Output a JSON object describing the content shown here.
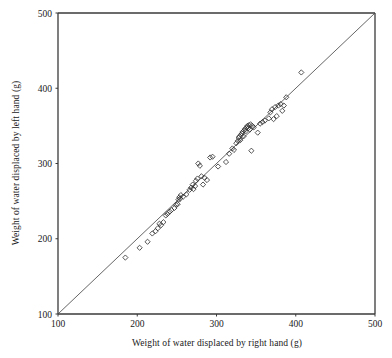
{
  "chart_data": {
    "type": "scatter",
    "title": "",
    "xlabel": "Weight of water displaced by right hand (g)",
    "ylabel": "Weight of water displaced by left hand (g)",
    "xlim": [
      100,
      500
    ],
    "ylim": [
      100,
      500
    ],
    "xticks": [
      100,
      200,
      300,
      400,
      500
    ],
    "yticks": [
      100,
      200,
      300,
      400,
      500
    ],
    "grid": false,
    "legend": null,
    "marker": "open-diamond",
    "marker_size": 4,
    "reference_line": {
      "name": "identity-line",
      "type": "line",
      "slope": 1,
      "intercept": 0,
      "x": [
        100,
        500
      ],
      "y": [
        100,
        500
      ]
    },
    "points": [
      [
        185,
        175
      ],
      [
        203,
        188
      ],
      [
        213,
        196
      ],
      [
        219,
        207
      ],
      [
        223,
        210
      ],
      [
        226,
        214
      ],
      [
        228,
        220
      ],
      [
        230,
        218
      ],
      [
        233,
        222
      ],
      [
        236,
        231
      ],
      [
        238,
        233
      ],
      [
        241,
        236
      ],
      [
        243,
        238
      ],
      [
        247,
        241
      ],
      [
        249,
        245
      ],
      [
        251,
        246
      ],
      [
        252,
        252
      ],
      [
        253,
        255
      ],
      [
        254,
        253
      ],
      [
        255,
        258
      ],
      [
        258,
        256
      ],
      [
        262,
        259
      ],
      [
        266,
        265
      ],
      [
        268,
        268
      ],
      [
        270,
        272
      ],
      [
        271,
        266
      ],
      [
        273,
        270
      ],
      [
        274,
        277
      ],
      [
        276,
        280
      ],
      [
        277,
        300
      ],
      [
        279,
        297
      ],
      [
        281,
        283
      ],
      [
        283,
        272
      ],
      [
        285,
        281
      ],
      [
        288,
        278
      ],
      [
        292,
        308
      ],
      [
        295,
        309
      ],
      [
        302,
        296
      ],
      [
        312,
        302
      ],
      [
        316,
        313
      ],
      [
        320,
        320
      ],
      [
        322,
        318
      ],
      [
        325,
        327
      ],
      [
        327,
        330
      ],
      [
        328,
        334
      ],
      [
        329,
        336
      ],
      [
        330,
        331
      ],
      [
        331,
        338
      ],
      [
        332,
        340
      ],
      [
        333,
        342
      ],
      [
        334,
        336
      ],
      [
        335,
        344
      ],
      [
        336,
        346
      ],
      [
        337,
        343
      ],
      [
        338,
        348
      ],
      [
        339,
        350
      ],
      [
        340,
        347
      ],
      [
        341,
        351
      ],
      [
        342,
        345
      ],
      [
        343,
        352
      ],
      [
        344,
        317
      ],
      [
        345,
        350
      ],
      [
        347,
        348
      ],
      [
        352,
        341
      ],
      [
        355,
        353
      ],
      [
        358,
        355
      ],
      [
        361,
        357
      ],
      [
        366,
        360
      ],
      [
        368,
        368
      ],
      [
        370,
        372
      ],
      [
        372,
        359
      ],
      [
        374,
        375
      ],
      [
        376,
        363
      ],
      [
        378,
        377
      ],
      [
        381,
        379
      ],
      [
        383,
        370
      ],
      [
        385,
        377
      ],
      [
        388,
        388
      ],
      [
        407,
        421
      ]
    ]
  },
  "axes": {
    "x_tick_labels": [
      "100",
      "200",
      "300",
      "400",
      "500"
    ],
    "y_tick_labels": [
      "100",
      "200",
      "300",
      "400",
      "500"
    ]
  }
}
